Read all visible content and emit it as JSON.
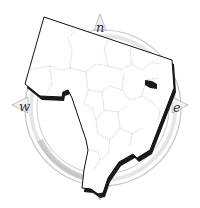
{
  "map": {
    "type": "county-outline",
    "compass": {
      "north_label": "n",
      "east_label": "e",
      "west_label": "w",
      "ring_color": "#b8b8b8",
      "ring_shade": "#e2e2e2"
    },
    "colors": {
      "outline": "#111111",
      "fill": "#ffffff",
      "shadow": "#1a1a1a",
      "internal_boundaries": "#b5b5b5",
      "highlight": "#1a1a1a"
    },
    "highlighted_region": "east-municipality-dark"
  }
}
